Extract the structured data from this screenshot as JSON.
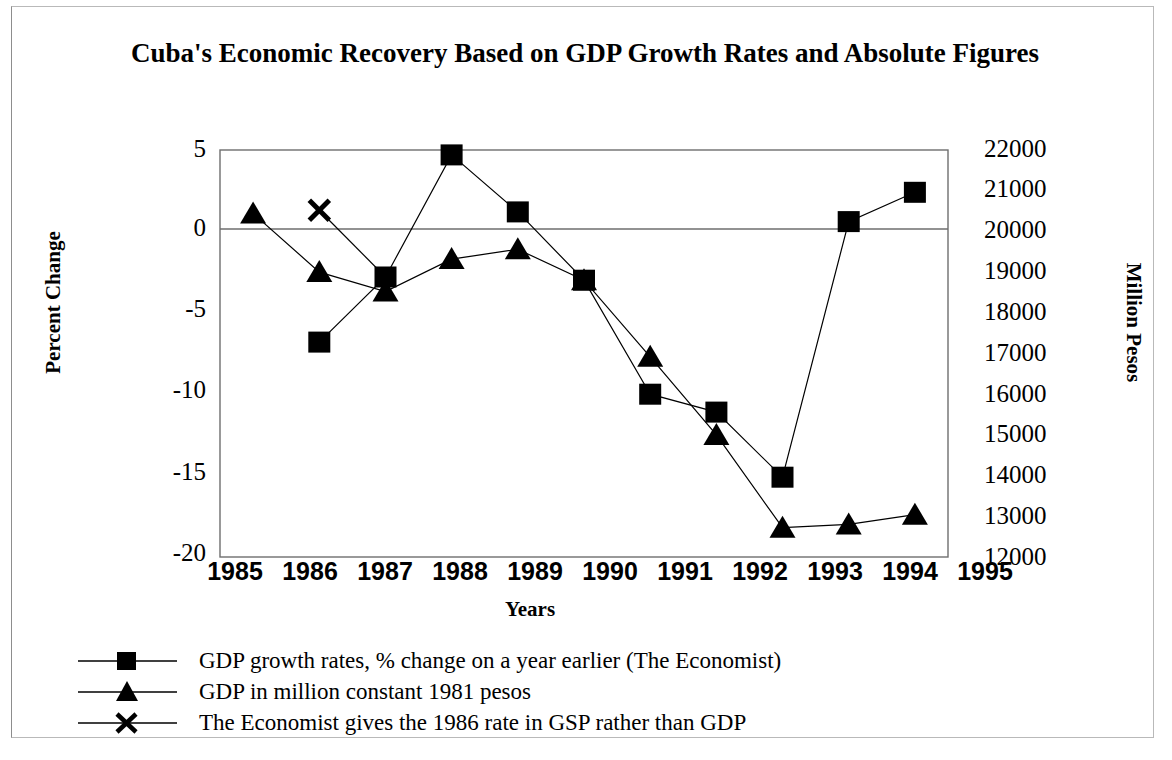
{
  "chart_data": {
    "type": "line",
    "title": "Cuba's Economic Recovery Based on GDP Growth Rates and Absolute Figures",
    "xlabel": "Years",
    "ylabel": "Percent Change",
    "ylabel_right": "Million Pesos",
    "categories": [
      "1985",
      "1986",
      "1987",
      "1988",
      "1989",
      "1990",
      "1991",
      "1992",
      "1993",
      "1994",
      "1995"
    ],
    "ylim": [
      -20,
      5
    ],
    "yticks": [
      "5",
      "0",
      "-5",
      "-10",
      "-15",
      "-20"
    ],
    "ylim_right": [
      12000,
      22000
    ],
    "yticks_right": [
      "22000",
      "21000",
      "20000",
      "19000",
      "18000",
      "17000",
      "16000",
      "15000",
      "14000",
      "13000",
      "12000"
    ],
    "grid": false,
    "legend_position": "below",
    "series": [
      {
        "name": "GDP growth rates, % change on a year earlier (The Economist)",
        "marker": "square",
        "axis": "left",
        "x": [
          "1986",
          "1987",
          "1988",
          "1989",
          "1990",
          "1991",
          "1992",
          "1993",
          "1994",
          "1995"
        ],
        "values": [
          -6.8,
          -2.8,
          4.7,
          1.2,
          -3.0,
          -10.0,
          -11.1,
          -15.1,
          0.6,
          2.4
        ]
      },
      {
        "name": "GDP in million constant 1981 pesos",
        "marker": "triangle",
        "axis": "right",
        "x": [
          "1985",
          "1986",
          "1987",
          "1988",
          "1989",
          "1990",
          "1991",
          "1992",
          "1993",
          "1994",
          "1995"
        ],
        "values_percent_scale": [
          1.1,
          -2.5,
          -3.7,
          -1.7,
          -1.1,
          -3.0,
          -7.7,
          -12.5,
          -18.2,
          -18.0,
          -17.4
        ],
        "values": [
          20430,
          19980,
          19830,
          20240,
          20310,
          20070,
          19480,
          18860,
          18150,
          18170,
          18250
        ]
      },
      {
        "name": "The Economist gives the 1986 rate in GSP rather than GDP",
        "marker": "cross",
        "axis": "left",
        "x": [
          "1986"
        ],
        "values": [
          1.3
        ]
      }
    ]
  },
  "legend": {
    "entries": [
      {
        "marker": "square-marker",
        "label": "GDP growth rates, % change on a year earlier (The Economist)"
      },
      {
        "marker": "triangle-marker",
        "label": "GDP in million constant 1981 pesos"
      },
      {
        "marker": "cross-marker",
        "label": "The Economist gives the 1986 rate in GSP rather than GDP"
      }
    ]
  },
  "colors": {
    "ink": "#000000",
    "axis": "#555555",
    "frame": "#b9b9b9",
    "background": "#ffffff"
  }
}
